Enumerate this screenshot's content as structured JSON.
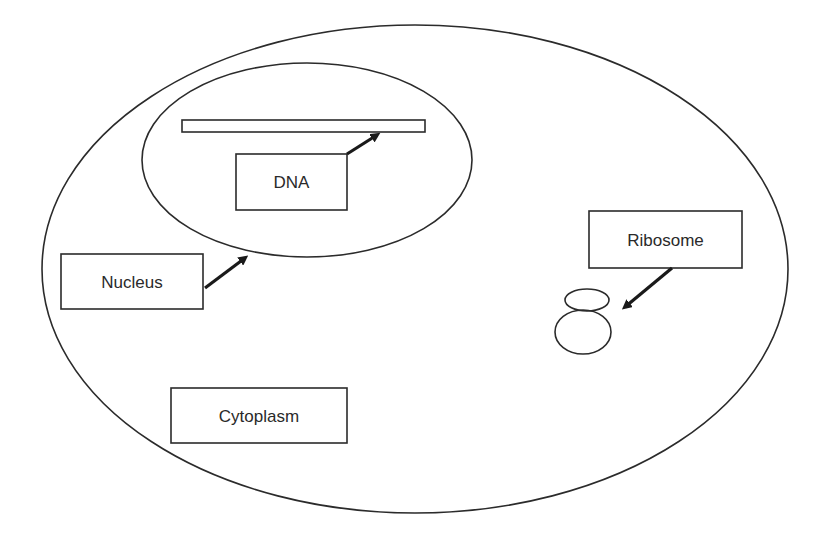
{
  "diagram": {
    "type": "cell-structure",
    "colors": {
      "stroke": "#2b2b2b",
      "text": "#2a2a2a",
      "background": "#ffffff"
    },
    "cell": {
      "label": "Cytoplasm"
    },
    "components": [
      {
        "id": "nucleus",
        "label": "Nucleus",
        "shape": "ellipse",
        "has_arrow": true
      },
      {
        "id": "dna",
        "label": "DNA",
        "shape": "bar",
        "has_arrow": true,
        "inside": "nucleus"
      },
      {
        "id": "ribosome",
        "label": "Ribosome",
        "shape": "two-stacked-ellipses",
        "has_arrow": true
      },
      {
        "id": "cytoplasm",
        "label": "Cytoplasm",
        "has_arrow": false
      }
    ],
    "labels": {
      "dna": "DNA",
      "nucleus": "Nucleus",
      "ribosome": "Ribosome",
      "cytoplasm": "Cytoplasm"
    }
  }
}
